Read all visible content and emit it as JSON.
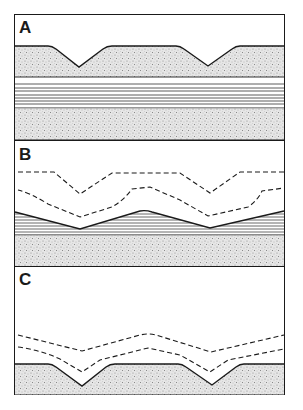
{
  "figure": {
    "type": "geological cross-section diagram",
    "panels": [
      {
        "label": "A",
        "description": "Sand surface with two V-shaped channels over laminated layer and lower sand"
      },
      {
        "label": "B",
        "description": "Laminated layer draped in wavy form with two dashed horizons above"
      },
      {
        "label": "C",
        "description": "Sand surface with two V-shaped channels and two dashed horizons above"
      }
    ]
  },
  "colors": {
    "line": "#1a1a1a",
    "sand": "#d4d4d4",
    "background": "#ffffff"
  }
}
